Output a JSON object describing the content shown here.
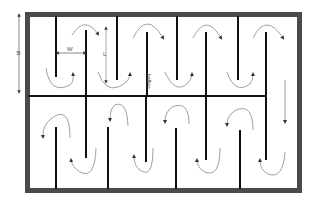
{
  "diagram": {
    "colors": {
      "wall": "#4a4a4a",
      "baffle": "#111111",
      "flow_arrow": "#888888",
      "dimension": "#888888"
    },
    "labels": {
      "width_dim": "B",
      "gap_dim": "W",
      "length_dim": "L",
      "baffles": "baffles"
    },
    "frame": {
      "x": 25,
      "y": 12,
      "w": 277,
      "h": 181,
      "thickness": 5
    },
    "middle_wall": {
      "y": 96,
      "x1": 28,
      "x2": 266
    },
    "top_baffles_from_wall": [
      56,
      117,
      177,
      238
    ],
    "top_baffles_from_middle": [
      86,
      147,
      206,
      266
    ],
    "bottom_baffles_from_middle": [
      86,
      146,
      206,
      266
    ],
    "bottom_baffles_from_wall": [
      56,
      108,
      176,
      240
    ]
  }
}
